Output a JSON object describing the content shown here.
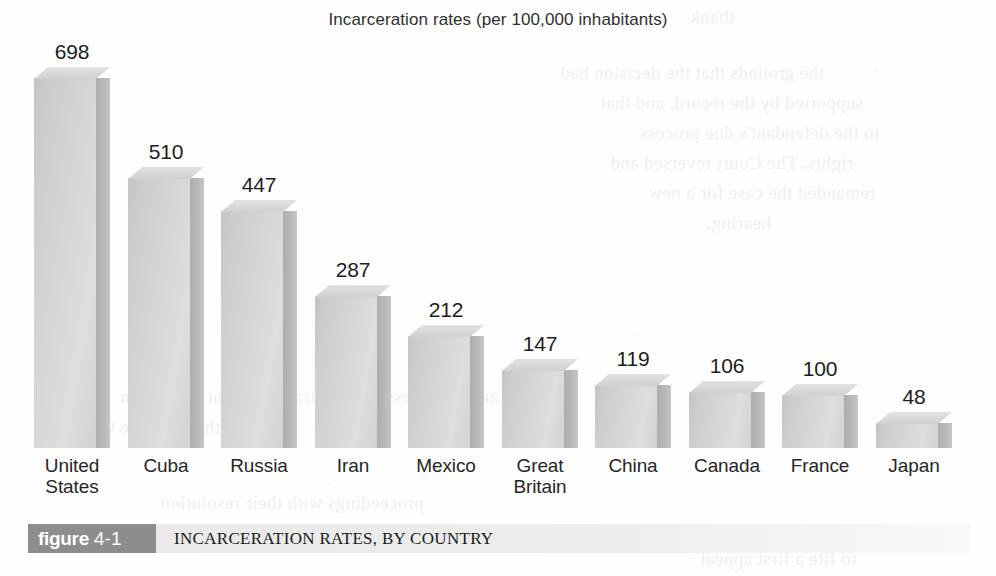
{
  "chart_data": {
    "type": "bar",
    "title": "Incarceration rates (per 100,000 inhabitants)",
    "xlabel": "",
    "ylabel": "",
    "ylim": [
      0,
      698
    ],
    "grid": false,
    "legend": "none",
    "categories": [
      "United States",
      "Cuba",
      "Russia",
      "Iran",
      "Mexico",
      "Great Britain",
      "China",
      "Canada",
      "France",
      "Japan"
    ],
    "values": [
      698,
      510,
      447,
      287,
      212,
      147,
      119,
      106,
      100,
      48
    ],
    "value_labels": [
      "698",
      "510",
      "447",
      "287",
      "212",
      "147",
      "119",
      "106",
      "100",
      "48"
    ],
    "category_lines": [
      [
        "United",
        "States"
      ],
      [
        "Cuba"
      ],
      [
        "Russia"
      ],
      [
        "Iran"
      ],
      [
        "Mexico"
      ],
      [
        "Great",
        "Britain"
      ],
      [
        "China"
      ],
      [
        "Canada"
      ],
      [
        "France"
      ],
      [
        "Japan"
      ]
    ],
    "bar_style": "3d-extruded",
    "bar_color": "#d6d6d6",
    "bar_side_color": "#b4b4b4",
    "bar_top_color": "#e2e2e2"
  },
  "figure": {
    "badge_word": "figure",
    "badge_number": "4-1",
    "caption": "INCARCERATION RATES, BY COUNTRY",
    "badge_color": "#8d8d8d",
    "bar_color": "#ececec"
  },
  "bleed_through": {
    "lines": [
      "thank",
      "the grounds that the decision had",
      "supported by the record, and that",
      "to the defendant's due process",
      "rights. The Court reversed and",
      "remanded the case for a new",
      "hearing.",
      "are not necessarily contradictory but the reason",
      "ment to the Supreme Court the",
      "proceedings with their resolution",
      "to file a first appeal"
    ]
  }
}
